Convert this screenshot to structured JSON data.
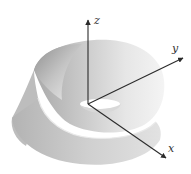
{
  "figure": {
    "axes": {
      "z": {
        "label": "z"
      },
      "y": {
        "label": "y"
      },
      "x": {
        "label": "x"
      }
    },
    "colors": {
      "background": "#ffffff",
      "strip_light": "#f2f2f2",
      "strip_mid": "#d4d4d4",
      "strip_dark": "#a9a9a9",
      "axis": "#2b2b2b"
    }
  }
}
